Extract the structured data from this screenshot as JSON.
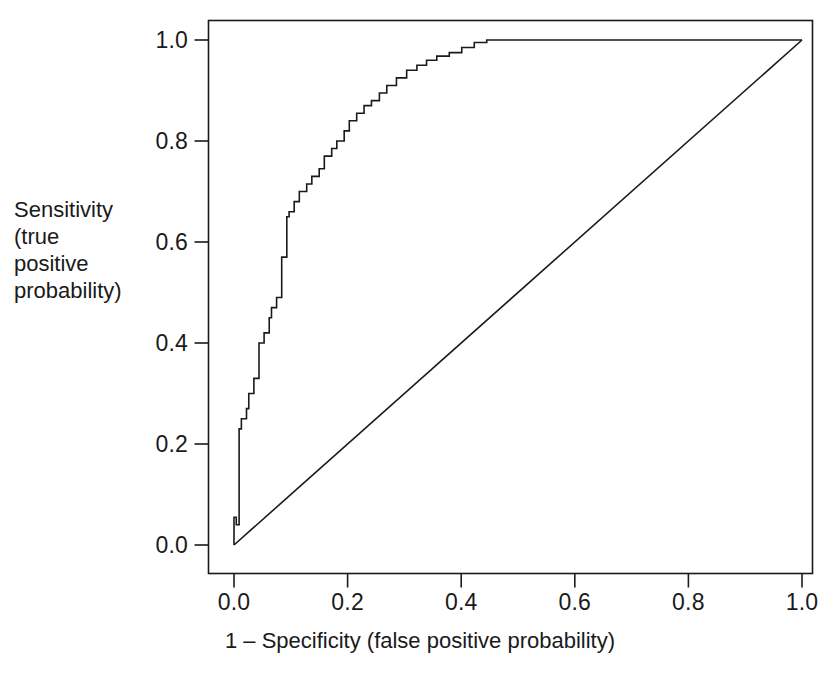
{
  "chart_data": {
    "type": "line",
    "title": "",
    "subtitle": "",
    "xlabel": "1 – Specificity (false positive probability)",
    "ylabel_lines": [
      "Sensitivity",
      "(true",
      "positive",
      "probability)"
    ],
    "ylabel": "Sensitivity (true positive probability)",
    "xlim": [
      0.0,
      1.0
    ],
    "ylim": [
      0.0,
      1.0
    ],
    "grid": false,
    "legend": null,
    "legend_position": "none",
    "xticks": [
      0.0,
      0.2,
      0.4,
      0.6,
      0.8,
      1.0
    ],
    "xtick_labels": [
      "0.0",
      "0.2",
      "0.4",
      "0.6",
      "0.8",
      "1.0"
    ],
    "yticks": [
      0.0,
      0.2,
      0.4,
      0.6,
      0.8,
      1.0
    ],
    "ytick_labels": [
      "0.0",
      "0.2",
      "0.4",
      "0.6",
      "0.8",
      "1.0"
    ],
    "line_color": "#1a1a1a",
    "series": [
      {
        "name": "ROC curve",
        "style": "step",
        "x": [
          0.0,
          0.0,
          0.0,
          0.004,
          0.004,
          0.009,
          0.009,
          0.009,
          0.013,
          0.013,
          0.022,
          0.022,
          0.026,
          0.026,
          0.035,
          0.035,
          0.044,
          0.044,
          0.053,
          0.053,
          0.062,
          0.062,
          0.066,
          0.066,
          0.075,
          0.075,
          0.084,
          0.084,
          0.093,
          0.093,
          0.097,
          0.097,
          0.106,
          0.106,
          0.115,
          0.115,
          0.128,
          0.128,
          0.137,
          0.137,
          0.15,
          0.15,
          0.159,
          0.159,
          0.172,
          0.172,
          0.181,
          0.181,
          0.194,
          0.194,
          0.203,
          0.203,
          0.216,
          0.216,
          0.229,
          0.229,
          0.242,
          0.242,
          0.256,
          0.256,
          0.269,
          0.269,
          0.286,
          0.286,
          0.304,
          0.304,
          0.322,
          0.322,
          0.339,
          0.339,
          0.357,
          0.357,
          0.379,
          0.379,
          0.401,
          0.401,
          0.423,
          0.423,
          0.445,
          0.445,
          1.0
        ],
        "y": [
          0.0,
          0.04,
          0.055,
          0.055,
          0.04,
          0.04,
          0.19,
          0.23,
          0.23,
          0.25,
          0.25,
          0.27,
          0.27,
          0.3,
          0.3,
          0.33,
          0.33,
          0.4,
          0.4,
          0.42,
          0.42,
          0.45,
          0.45,
          0.47,
          0.47,
          0.49,
          0.49,
          0.57,
          0.57,
          0.65,
          0.65,
          0.66,
          0.66,
          0.68,
          0.68,
          0.7,
          0.7,
          0.715,
          0.715,
          0.73,
          0.73,
          0.745,
          0.745,
          0.77,
          0.77,
          0.785,
          0.785,
          0.8,
          0.8,
          0.82,
          0.82,
          0.84,
          0.84,
          0.855,
          0.855,
          0.87,
          0.87,
          0.88,
          0.88,
          0.895,
          0.895,
          0.91,
          0.91,
          0.925,
          0.925,
          0.94,
          0.94,
          0.95,
          0.95,
          0.96,
          0.96,
          0.968,
          0.968,
          0.975,
          0.975,
          0.985,
          0.985,
          0.995,
          0.995,
          1.0,
          1.0
        ]
      },
      {
        "name": "Chance diagonal",
        "style": "line",
        "x": [
          0.0,
          1.0
        ],
        "y": [
          0.0,
          1.0
        ]
      }
    ]
  },
  "axes": {
    "ylabel_lines": [
      "Sensitivity",
      "(true",
      "positive",
      "probability)"
    ],
    "xlabel": "1 – Specificity (false positive probability)",
    "xtick_labels": [
      "0.0",
      "0.2",
      "0.4",
      "0.6",
      "0.8",
      "1.0"
    ],
    "ytick_labels": [
      "0.0",
      "0.2",
      "0.4",
      "0.6",
      "0.8",
      "1.0"
    ]
  },
  "colors": {
    "line": "#1a1a1a",
    "axis": "#1a1a1a",
    "background": "#ffffff"
  }
}
